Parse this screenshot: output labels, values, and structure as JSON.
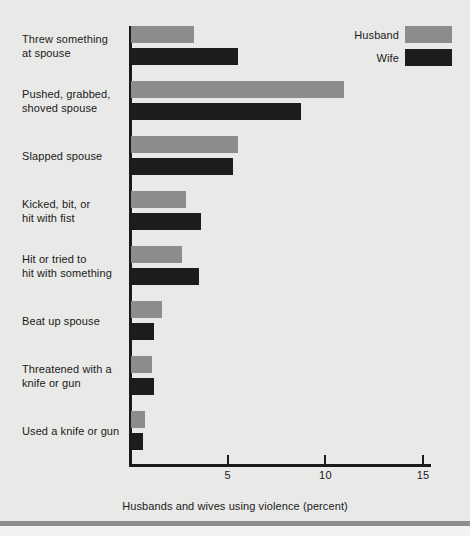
{
  "chart_data": {
    "type": "bar",
    "orientation": "horizontal",
    "title": "",
    "xlabel": "Husbands and wives using violence (percent)",
    "ylabel": "",
    "xlim": [
      0,
      15.5
    ],
    "xticks": [
      5,
      10,
      15
    ],
    "xtick_labels": [
      "5",
      "10",
      "15"
    ],
    "grid": false,
    "legend_position": "top-right",
    "categories": [
      "Threw something at spouse",
      "Pushed, grabbed, shoved spouse",
      "Slapped spouse",
      "Kicked, bit, or hit with fist",
      "Hit or tried to hit with something",
      "Beat up spouse",
      "Threatened with a knife or gun",
      "Used a knife or gun"
    ],
    "category_lines": [
      [
        "Threw something",
        "at spouse"
      ],
      [
        "Pushed, grabbed,",
        "shoved spouse"
      ],
      [
        "Slapped spouse"
      ],
      [
        "Kicked, bit, or",
        "hit with fist"
      ],
      [
        "Hit or tried to",
        "hit with something"
      ],
      [
        "Beat up spouse"
      ],
      [
        "Threatened with a",
        "knife or gun"
      ],
      [
        "Used a knife or gun"
      ]
    ],
    "series": [
      {
        "name": "Husband",
        "color": "#8c8c8c",
        "values": [
          3.2,
          10.9,
          5.5,
          2.8,
          2.6,
          1.6,
          1.1,
          0.7
        ]
      },
      {
        "name": "Wife",
        "color": "#1c1c1c",
        "values": [
          5.5,
          8.7,
          5.2,
          3.6,
          3.5,
          1.2,
          1.2,
          0.6
        ]
      }
    ]
  },
  "legend": {
    "items": [
      {
        "label": "Husband",
        "color": "#8c8c8c"
      },
      {
        "label": "Wife",
        "color": "#1c1c1c"
      }
    ]
  },
  "figure": {
    "background": "#e9e9e7",
    "axis_color": "#1a1a1a"
  }
}
